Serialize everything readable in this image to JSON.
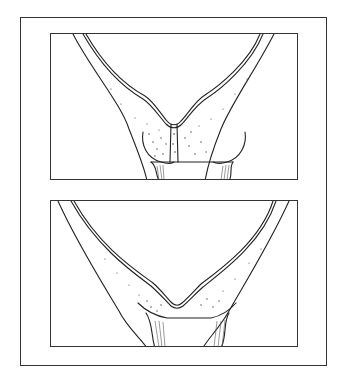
{
  "figure": {
    "type": "anatomical line illustration",
    "panels": [
      {
        "id": "top",
        "description": "V-shaped cavity narrowing to a closed, stippled tissue junction above a tubular canal"
      },
      {
        "id": "bottom",
        "description": "V-shaped cavity with shallower junction opening onto a widened canal"
      }
    ],
    "colors": {
      "line": "#222222",
      "stipple": "#444444",
      "background": "#ffffff"
    }
  }
}
